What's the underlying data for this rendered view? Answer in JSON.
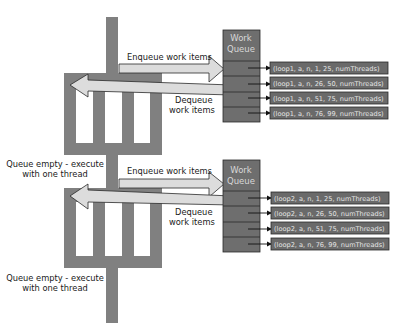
{
  "colors": {
    "thread_gray": "#808080",
    "queue_gray": "#6e6e6e",
    "item_gray": "#6a6a6a",
    "arrow_fill": "#dcdcdc",
    "outline": "#2a2a2a"
  },
  "stages": [
    {
      "enqueue_label": "Enqueue work items",
      "dequeue_label_line1": "Dequeue",
      "dequeue_label_line2": "work items",
      "queue_title_line1": "Work",
      "queue_title_line2": "Queue",
      "items": [
        "(loop1, a, n, 1, 25, numThreads)",
        "(loop1, a, n, 26, 50, numThreads)",
        "(loop1, a, n, 51, 75, numThreads)",
        "(loop1, a, n, 76, 99, numThreads)"
      ],
      "empty_label_line1": "Queue empty - execute",
      "empty_label_line2": "with one thread"
    },
    {
      "enqueue_label": "Enqueue work items",
      "dequeue_label_line1": "Dequeue",
      "dequeue_label_line2": "work items",
      "queue_title_line1": "Work",
      "queue_title_line2": "Queue",
      "items": [
        "(loop2, a, n, 1, 25, numThreads)",
        "(loop2, a, n, 26, 50, numThreads)",
        "(loop2, a, n, 51, 75, numThreads)",
        "(loop2, a, n, 76, 99, numThreads)"
      ],
      "empty_label_line1": "Queue empty - execute",
      "empty_label_line2": "with one thread"
    }
  ]
}
